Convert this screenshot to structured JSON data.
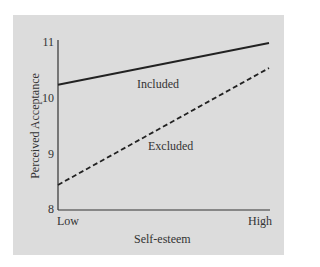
{
  "chart_data": {
    "type": "line",
    "title": "",
    "xlabel": "Self-esteem",
    "ylabel": "Perceived Acceptance",
    "categories": [
      "Low",
      "High"
    ],
    "ylim": [
      8,
      11
    ],
    "yticks": [
      "8",
      "9",
      "10",
      "11"
    ],
    "grid": false,
    "legend": "inline labels",
    "series": [
      {
        "name": "Included",
        "style": "solid",
        "values": [
          10.25,
          11.0
        ]
      },
      {
        "name": "Excluded",
        "style": "dashed",
        "values": [
          8.45,
          10.55
        ]
      }
    ]
  },
  "colors": {
    "panel_background": "#dcdcdc",
    "line": "#222222",
    "text": "#333333"
  }
}
